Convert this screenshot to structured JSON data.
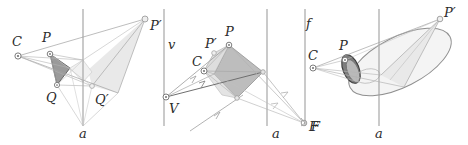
{
  "figure": {
    "panel_count": 3,
    "background_color": "#ffffff",
    "stroke_color": "#8f8f8f",
    "dark_stroke_color": "#555555",
    "label_color": "#2b2b2b",
    "fill_light": "#e6e6e6",
    "fill_mid": "#cfcfcf",
    "fill_dark": "#8a8a8a"
  },
  "panels": [
    {
      "id": "panel-left",
      "name": "triangle-projection-panel",
      "axis_label": "a",
      "labels": [
        {
          "key": "C",
          "text": "C",
          "x": 12,
          "y": 46
        },
        {
          "key": "P",
          "text": "P",
          "x": 42,
          "y": 42
        },
        {
          "key": "Q",
          "text": "Q",
          "x": 46,
          "y": 95
        },
        {
          "key": "Pp",
          "text": "P′",
          "x": 134,
          "y": 33
        },
        {
          "key": "Qp",
          "text": "Q′",
          "x": 97,
          "y": 99
        },
        {
          "key": "a",
          "text": "a",
          "x": 79,
          "y": 133
        }
      ],
      "markers": [
        {
          "key": "C",
          "x": 18,
          "y": 56,
          "type": "circle-dot"
        },
        {
          "key": "P",
          "x": 50,
          "y": 54,
          "type": "circle-dot"
        },
        {
          "key": "Q",
          "x": 57,
          "y": 85,
          "type": "circle-dot"
        },
        {
          "key": "Pp",
          "x": 145,
          "y": 19,
          "type": "circle-dot"
        },
        {
          "key": "Qp",
          "x": 92,
          "y": 86,
          "type": "circle-dot"
        }
      ],
      "axis_line": {
        "x": 83,
        "y1": 9,
        "y2": 126
      }
    },
    {
      "id": "panel-middle",
      "name": "vanishing-point-panel",
      "axis_label": "a",
      "vertical_label": "v",
      "labels": [
        {
          "key": "v",
          "text": "v",
          "x": 170,
          "y": 45
        },
        {
          "key": "C",
          "text": "C",
          "x": 198,
          "y": 62
        },
        {
          "key": "Pp",
          "text": "P′",
          "x": 209,
          "y": 47
        },
        {
          "key": "P",
          "text": "P",
          "x": 228,
          "y": 38
        },
        {
          "key": "V",
          "text": "V",
          "x": 172,
          "y": 126
        },
        {
          "key": "a",
          "text": "a",
          "x": 272,
          "y": 133
        },
        {
          "key": "F",
          "text": "F",
          "x": 309,
          "y": 127
        }
      ],
      "markers": [
        {
          "key": "C",
          "x": 204,
          "y": 71,
          "type": "circle-dot"
        },
        {
          "key": "P",
          "x": 229,
          "y": 45,
          "type": "circle-dot"
        },
        {
          "key": "V",
          "x": 166,
          "y": 97,
          "type": "circle-dot"
        },
        {
          "key": "F",
          "x": 304,
          "y": 123,
          "type": "circle-dot"
        }
      ],
      "axis_line": {
        "x": 267,
        "y1": 9,
        "y2": 126
      },
      "vertical_line": {
        "x": 164,
        "y1": 9,
        "y2": 126
      }
    },
    {
      "id": "panel-right",
      "name": "conic-projection-panel",
      "axis_label": "a",
      "vertical_label": "f",
      "labels": [
        {
          "key": "f",
          "text": "f",
          "x": 307,
          "y": 24
        },
        {
          "key": "C",
          "text": "C",
          "x": 312,
          "y": 57
        },
        {
          "key": "P",
          "text": "P",
          "x": 341,
          "y": 50
        },
        {
          "key": "F",
          "text": "F",
          "x": 316,
          "y": 127
        },
        {
          "key": "Pp",
          "text": "P′",
          "x": 444,
          "y": 22
        },
        {
          "key": "a",
          "text": "a",
          "x": 375,
          "y": 133
        }
      ],
      "markers": [
        {
          "key": "C",
          "x": 313,
          "y": 68,
          "type": "circle-dot"
        },
        {
          "key": "P",
          "x": 345,
          "y": 60,
          "type": "circle-dot"
        },
        {
          "key": "F",
          "x": 305,
          "y": 123,
          "type": "circle-dot"
        },
        {
          "key": "Pp",
          "x": 440,
          "y": 19,
          "type": "circle-dot"
        }
      ],
      "axis_line": {
        "x": 379,
        "y1": 9,
        "y2": 126
      },
      "vertical_line": {
        "x": 305,
        "y1": 9,
        "y2": 126
      }
    }
  ]
}
